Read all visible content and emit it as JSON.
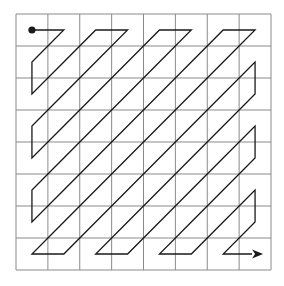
{
  "diagram": {
    "grid_rows": 8,
    "grid_cols": 8,
    "scan": "zigzag",
    "start_marker": "dot",
    "end_marker": "arrow",
    "colors": {
      "grid": "#8a8a8a",
      "path": "#1a1a1a",
      "background": "#ffffff"
    }
  }
}
